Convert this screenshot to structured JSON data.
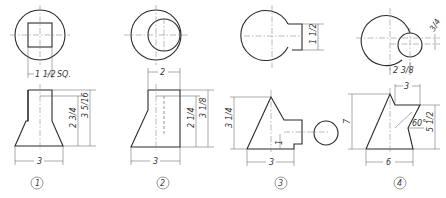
{
  "figures": [
    {
      "label": "1",
      "top_view_dim": "1 1/2",
      "top_view_note": "SQ.",
      "front_width": "3",
      "front_height_inner": "2 3/4",
      "front_height_outer": "3 5/16"
    },
    {
      "label": "2",
      "top_view_dim": "2",
      "front_width": "3",
      "front_height_inner": "2 1/4",
      "front_height_outer": "3 1/8"
    },
    {
      "label": "3",
      "top_view_dim": "1 1/2",
      "front_width": "3",
      "front_height": "3 1/4",
      "notch_height": "1"
    },
    {
      "label": "4",
      "top_view_offset": "2 3/8",
      "top_view_small": "3/4",
      "front_top_width": "3",
      "front_width": "6",
      "front_height": "7",
      "front_right_height": "5 1/2",
      "angle": "60°"
    }
  ]
}
